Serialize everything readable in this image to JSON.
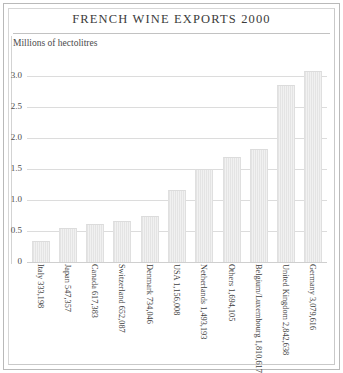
{
  "chart_data": {
    "type": "bar",
    "title": "FRENCH WINE EXPORTS 2000",
    "subtitle": "Millions of hectolitres",
    "xlabel": "",
    "ylabel": "Millions of hectolitres",
    "ylim": [
      0,
      3.25
    ],
    "grid": true,
    "legend": "none",
    "ytick_labels": [
      "3.0",
      "2.5",
      "2.0",
      "1.5",
      "1.0",
      "0.5",
      "0"
    ],
    "ytick_values": [
      3.0,
      2.5,
      2.0,
      1.5,
      1.0,
      0.5,
      0
    ],
    "categories": [
      "Italy",
      "Japan",
      "Canada",
      "Switzerland",
      "Denmark",
      "USA",
      "Netherlands",
      "Others",
      "Belgium/Luxembourg",
      "United Kingdom",
      "Germany"
    ],
    "value_labels": [
      "333,198",
      "547,357",
      "617,383",
      "652,087",
      "734,046",
      "1,156,008",
      "1,493,193",
      "1,694,105",
      "1,810,617",
      "2,842,638",
      "3,079,616"
    ],
    "values": [
      0.333198,
      0.547357,
      0.617383,
      0.652087,
      0.734046,
      1.156008,
      1.493193,
      1.694105,
      1.810617,
      2.842638,
      3.079616
    ],
    "units": "millions of hectolitres",
    "bar_color": "#ebebeb",
    "grid_color": "#dcdcdc",
    "text_color": "#3f3f3f"
  }
}
